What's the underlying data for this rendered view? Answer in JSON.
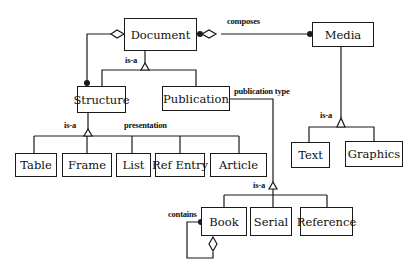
{
  "diagram": {
    "type": "object model / class hierarchy",
    "line_color": "#1a1a1a",
    "nodes": {
      "document": "Document",
      "media": "Media",
      "structure": "Structure",
      "publication": "Publication",
      "table": "Table",
      "frame": "Frame",
      "list": "List",
      "ref_entry": "Ref Entry",
      "article": "Article",
      "text": "Text",
      "graphics": "Graphics",
      "book": "Book",
      "serial": "Serial",
      "reference": "Reference"
    },
    "labels": {
      "composes": "composes",
      "doc_is_a": "is-a",
      "structure_is_a": "is-a",
      "presentation": "presentation",
      "publication_type": "publication type",
      "pub_is_a": "is-a",
      "media_is_a": "is-a",
      "contains": "contains"
    },
    "edges": [
      {
        "from": "Document",
        "to": "Media",
        "kind": "aggregation",
        "label": "composes"
      },
      {
        "from": "Document",
        "to": "Structure",
        "kind": "aggregation"
      },
      {
        "from": "Document",
        "to": [
          "Structure",
          "Publication"
        ],
        "kind": "is-a"
      },
      {
        "from": "Structure",
        "to": [
          "Table",
          "Frame",
          "List",
          "Ref Entry",
          "Article"
        ],
        "kind": "is-a",
        "label": "presentation"
      },
      {
        "from": "Publication",
        "to": [
          "Book",
          "Serial",
          "Reference"
        ],
        "kind": "is-a",
        "label": "publication type"
      },
      {
        "from": "Media",
        "to": [
          "Text",
          "Graphics"
        ],
        "kind": "is-a"
      },
      {
        "from": "Book",
        "to": "Book",
        "kind": "aggregation",
        "label": "contains"
      }
    ]
  }
}
